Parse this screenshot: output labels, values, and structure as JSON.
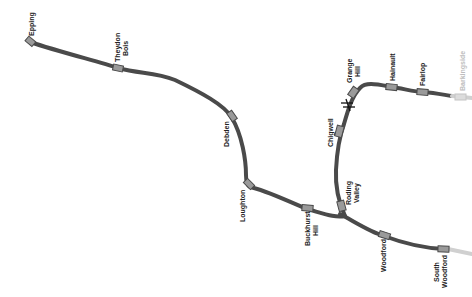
{
  "map": {
    "line": "Central line (eastern branches)",
    "colors": {
      "track": "#4a4a4a",
      "station_fill": "#9a9a9a",
      "faded_track": "#d0d0d0",
      "faded_station": "#dcdcdc",
      "faded_label": "#bdbdbd"
    },
    "stations": {
      "epping": "Epping",
      "theydon_bois_1": "Theydon",
      "theydon_bois_2": "Bois",
      "debden": "Debden",
      "loughton": "Loughton",
      "buckhurst_hill_1": "Buckhurst",
      "buckhurst_hill_2": "Hill",
      "woodford": "Woodford",
      "south_woodford_1": "South",
      "south_woodford_2": "Woodford",
      "roding_valley_1": "Roding",
      "roding_valley_2": "Valley",
      "chigwell": "Chigwell",
      "grange_hill_1": "Grange",
      "grange_hill_2": "Hill",
      "hainault": "Hainault",
      "fairlop": "Fairlop",
      "barkingside": "Barkingside"
    },
    "annotations": {
      "closure_marker": "closure-cross between Chigwell and Grange Hill"
    }
  }
}
